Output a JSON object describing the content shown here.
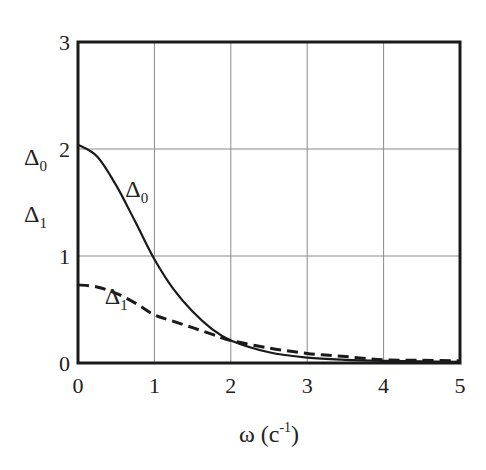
{
  "chart_data": {
    "type": "line",
    "title": "",
    "xlabel": "ω (c⁻¹)",
    "xlabel_parts": {
      "main": "ω (c",
      "sup": "-1",
      "close": ")"
    },
    "ylabel": "Δ0 Δ1",
    "ylabel_parts": [
      {
        "symbol": "Δ",
        "sub": "0"
      },
      {
        "symbol": "Δ",
        "sub": "1"
      }
    ],
    "xlim": [
      0,
      5
    ],
    "ylim": [
      0,
      3
    ],
    "x_ticks": [
      "0",
      "1",
      "2",
      "3",
      "4",
      "5"
    ],
    "y_ticks": [
      "0",
      "1",
      "2",
      "3"
    ],
    "grid": true,
    "legend": "inline curve labels",
    "x": [
      0,
      0.25,
      0.5,
      0.75,
      1,
      1.25,
      1.5,
      1.75,
      2,
      2.5,
      3,
      3.5,
      4,
      4.5,
      5
    ],
    "series": [
      {
        "name": "Δ0",
        "label_symbol": "Δ",
        "label_sub": "0",
        "style": "solid",
        "values": [
          2.04,
          1.93,
          1.66,
          1.32,
          0.97,
          0.69,
          0.48,
          0.32,
          0.21,
          0.1,
          0.05,
          0.03,
          0.02,
          0.015,
          0.01
        ],
        "label_at": [
          0.62,
          1.55
        ]
      },
      {
        "name": "Δ1",
        "label_symbol": "Δ",
        "label_sub": "1",
        "style": "dashed",
        "values": [
          0.73,
          0.71,
          0.65,
          0.56,
          0.45,
          0.39,
          0.33,
          0.27,
          0.21,
          0.14,
          0.09,
          0.06,
          0.03,
          0.025,
          0.02
        ],
        "label_at": [
          0.35,
          0.55
        ]
      }
    ],
    "colors": {
      "line": "#1a1a1a",
      "grid": "#8a8a8a",
      "frame": "#1a1a1a"
    }
  }
}
